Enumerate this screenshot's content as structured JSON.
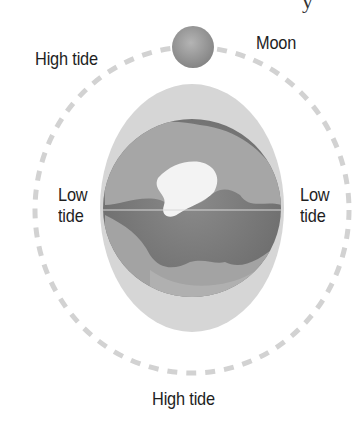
{
  "diagram": {
    "type": "tidal-bulge-illustration",
    "labels": {
      "high_tide_top": "High tide",
      "moon": "Moon",
      "low_tide_left_line1": "Low",
      "low_tide_left_line2": "tide",
      "low_tide_right_line1": "Low",
      "low_tide_right_line2": "tide",
      "high_tide_bottom": "High tide"
    },
    "cut_off_top_glyph": "y",
    "elements": {
      "orbit": {
        "style": "dashed",
        "color": "#d0d0d0",
        "cx": 192,
        "cy": 210,
        "rx": 157,
        "ry": 163
      },
      "tidal_bulge": {
        "shape": "ellipse",
        "color": "#d6d6d6",
        "cx": 192,
        "cy": 208,
        "rx": 92,
        "ry": 124
      },
      "earth": {
        "shape": "circle",
        "ocean_color": "#7d7d7d",
        "land_color": "#a8a8a8",
        "ice_color": "#f4f4f4",
        "cx": 192,
        "cy": 208,
        "r": 89
      },
      "moon": {
        "shape": "circle",
        "color": "#9a9a9a",
        "cx": 193,
        "cy": 47,
        "r": 21
      }
    }
  }
}
